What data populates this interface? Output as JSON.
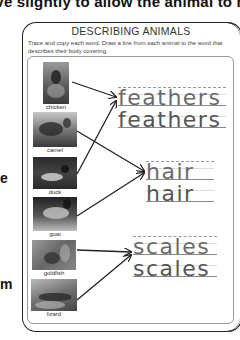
{
  "page": {
    "top_caption": "ove slightly to allow the animal to move",
    "side_letters": [
      "e",
      "m"
    ]
  },
  "worksheet": {
    "title": "DESCRIBING ANIMALS",
    "instructions": "Trace and copy each word. Draw a line from each animal to the word that describes their body covering."
  },
  "animals": [
    {
      "label": "chicken",
      "covering": "feathers"
    },
    {
      "label": "camel",
      "covering": "hair"
    },
    {
      "label": "duck",
      "covering": "feathers"
    },
    {
      "label": "goat",
      "covering": "hair"
    },
    {
      "label": "goldfish",
      "covering": "scales"
    },
    {
      "label": "lizard",
      "covering": "scales"
    }
  ],
  "words": [
    {
      "trace": "feathers",
      "copy": "feathers"
    },
    {
      "trace": "hair",
      "copy": "hair"
    },
    {
      "trace": "scales",
      "copy": "scales"
    }
  ],
  "colors": {
    "line": "#222222",
    "word_text": "#555555"
  }
}
